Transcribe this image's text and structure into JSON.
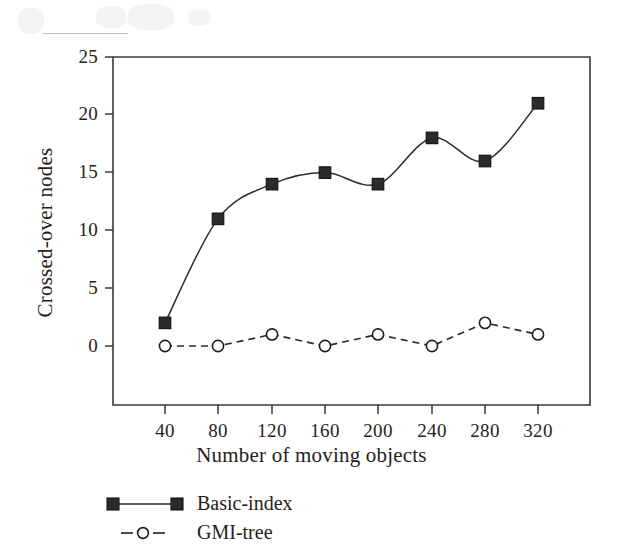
{
  "chart_data": {
    "type": "line",
    "title": "",
    "xlabel": "Number of moving objects",
    "ylabel": "Crossed-over nodes",
    "x": [
      40,
      80,
      120,
      160,
      200,
      240,
      280,
      320
    ],
    "xtick_labels": [
      "40",
      "80",
      "120",
      "160",
      "200",
      "240",
      "280",
      "320"
    ],
    "ytick_labels": [
      "0",
      "5",
      "10",
      "15",
      "20",
      "25"
    ],
    "yticks": [
      0,
      5,
      10,
      15,
      20,
      25
    ],
    "ylim": [
      -2.5,
      25
    ],
    "xlim": [
      11,
      362
    ],
    "grid": false,
    "legend_position": "below-axes-left",
    "series": [
      {
        "name": "Basic-index",
        "values": [
          2,
          11,
          14,
          15,
          14,
          18,
          16,
          21
        ],
        "marker": "filled-square",
        "linestyle": "solid",
        "color": "#2b2b2b"
      },
      {
        "name": "GMI-tree",
        "values": [
          0,
          0,
          1,
          0,
          1,
          0,
          2,
          1
        ],
        "marker": "open-circle",
        "linestyle": "dashed",
        "color": "#2b2b2b"
      }
    ]
  },
  "axes": {
    "xlabel": "Number of moving objects",
    "ylabel": "Crossed-over nodes"
  },
  "legend": {
    "items": [
      {
        "label": "Basic-index"
      },
      {
        "label": "GMI-tree"
      }
    ]
  },
  "colors": {
    "ink": "#262220",
    "line": "#2b2b2b",
    "background": "#ffffff"
  }
}
